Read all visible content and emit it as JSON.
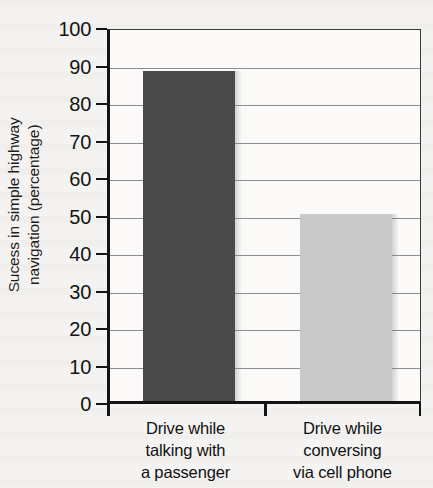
{
  "chart_data": {
    "type": "bar",
    "title": "",
    "xlabel": "",
    "ylabel": "Sucess in simple highway navigation (percentage)",
    "ylabel_lines": [
      "Sucess in simple highway",
      "navigation (percentage)"
    ],
    "categories": [
      "Drive while talking with a passenger",
      "Drive while conversing via cell phone"
    ],
    "category_lines": [
      [
        "Drive while",
        "talking with",
        "a passenger"
      ],
      [
        "Drive while",
        "conversing",
        "via cell phone"
      ]
    ],
    "values": [
      88,
      50
    ],
    "ylim": [
      0,
      100
    ],
    "ytick_labels": [
      "100",
      "90",
      "80",
      "70",
      "60",
      "50",
      "40",
      "30",
      "20",
      "10",
      "0"
    ],
    "ytick_values": [
      100,
      90,
      80,
      70,
      60,
      50,
      40,
      30,
      20,
      10,
      0
    ],
    "grid": true,
    "grid_axis": "y",
    "legend": "none",
    "bar_colors": [
      "#4a4a4a",
      "#c9c9c9"
    ],
    "axis_color": "#141414",
    "gridline_color": "#8e8e8e",
    "plot_background": "#fbfaf9",
    "page_background": "#f4f3f1"
  }
}
